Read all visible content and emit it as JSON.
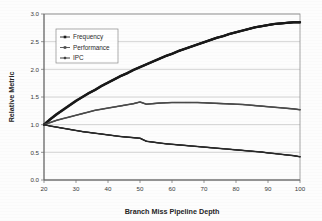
{
  "chart_data": {
    "type": "line",
    "title": "",
    "xlabel": "Branch Miss Pipeline Depth",
    "ylabel": "Relative Metric",
    "xlim": [
      20,
      100
    ],
    "ylim": [
      0.0,
      3.0
    ],
    "xticks": [
      20,
      30,
      40,
      50,
      60,
      70,
      80,
      90,
      100
    ],
    "xtick_labels": [
      "20",
      "30",
      "40",
      "50",
      "60",
      "70",
      "80",
      "90",
      "100"
    ],
    "yticks": [
      0.0,
      0.5,
      1.0,
      1.5,
      2.0,
      2.5,
      3.0
    ],
    "ytick_labels": [
      "0.0",
      "0.5",
      "1.0",
      "1.5",
      "2.0",
      "2.5",
      "3.0"
    ],
    "grid": "horizontal",
    "legend_position": "upper-left-inside",
    "x": [
      20,
      22,
      24,
      26,
      28,
      30,
      32,
      34,
      36,
      38,
      40,
      42,
      44,
      46,
      48,
      50,
      52,
      54,
      56,
      58,
      60,
      62,
      64,
      66,
      68,
      70,
      72,
      74,
      76,
      78,
      80,
      82,
      84,
      86,
      88,
      90,
      92,
      94,
      96,
      98,
      100
    ],
    "series": [
      {
        "name": "Frequency",
        "color": "#1a1a1a",
        "marker": "square",
        "values": [
          1.0,
          1.1,
          1.19,
          1.27,
          1.35,
          1.43,
          1.5,
          1.57,
          1.63,
          1.7,
          1.76,
          1.82,
          1.88,
          1.93,
          1.99,
          2.04,
          2.09,
          2.14,
          2.19,
          2.24,
          2.28,
          2.33,
          2.37,
          2.41,
          2.45,
          2.49,
          2.53,
          2.57,
          2.6,
          2.64,
          2.67,
          2.7,
          2.73,
          2.76,
          2.78,
          2.8,
          2.82,
          2.83,
          2.84,
          2.85,
          2.85
        ]
      },
      {
        "name": "Performance",
        "color": "#4a4a4a",
        "marker": "square",
        "values": [
          1.0,
          1.04,
          1.08,
          1.11,
          1.14,
          1.17,
          1.2,
          1.23,
          1.26,
          1.28,
          1.3,
          1.32,
          1.34,
          1.36,
          1.38,
          1.41,
          1.37,
          1.38,
          1.39,
          1.395,
          1.4,
          1.4,
          1.4,
          1.4,
          1.4,
          1.395,
          1.39,
          1.385,
          1.38,
          1.375,
          1.37,
          1.365,
          1.355,
          1.345,
          1.335,
          1.325,
          1.315,
          1.305,
          1.295,
          1.285,
          1.27
        ]
      },
      {
        "name": "IPC",
        "color": "#2a2a2a",
        "marker": "plus",
        "values": [
          1.0,
          0.975,
          0.955,
          0.935,
          0.915,
          0.895,
          0.875,
          0.86,
          0.845,
          0.83,
          0.815,
          0.8,
          0.785,
          0.775,
          0.765,
          0.755,
          0.7,
          0.685,
          0.67,
          0.655,
          0.645,
          0.635,
          0.625,
          0.615,
          0.605,
          0.595,
          0.585,
          0.575,
          0.565,
          0.555,
          0.545,
          0.535,
          0.525,
          0.515,
          0.505,
          0.49,
          0.478,
          0.465,
          0.452,
          0.44,
          0.42
        ]
      }
    ],
    "legend_entries": [
      {
        "label": "Frequency",
        "color": "#1a1a1a",
        "marker": "square"
      },
      {
        "label": "Performance",
        "color": "#4a4a4a",
        "marker": "square"
      },
      {
        "label": "IPC",
        "color": "#2a2a2a",
        "marker": "plus"
      }
    ]
  }
}
